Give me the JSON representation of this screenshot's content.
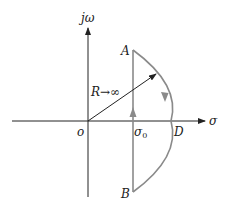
{
  "diagram": {
    "title": "",
    "axes": {
      "vertical_label": "jω",
      "horizontal_label": "σ",
      "origin_label": "o"
    },
    "points": {
      "A": "A",
      "B": "B",
      "D": "D",
      "sigma0": "σ",
      "sigma0_sub": "0"
    },
    "radius_label": "R→∞",
    "colors": {
      "axes": "#222222",
      "contour": "#8a8a8a",
      "background": "#ffffff"
    }
  }
}
